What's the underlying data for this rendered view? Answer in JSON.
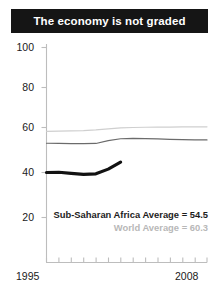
{
  "title": "The economy is not graded",
  "colors": {
    "title_bar_bg": "#151515",
    "title_text": "#ffffff",
    "axis": "#b0b0b0",
    "tick_text": "#1a1a1a",
    "series_africa": "#6b6b6b",
    "series_world": "#cfcfcf",
    "series_highlight": "#121212",
    "legend_africa_text": "#1c1c1c",
    "legend_world_text": "#b8b8b8"
  },
  "legend": {
    "africa": "Sub-Saharan Africa Average = 54.5",
    "world": "World Average = 60.3"
  },
  "axis": {
    "x_start_label": "1995",
    "x_end_label": "2008",
    "y_tick_labels": [
      "100",
      "80",
      "60",
      "40",
      "20"
    ]
  },
  "chart_data": {
    "type": "line",
    "title": "The economy is not graded",
    "xlabel": "",
    "ylabel": "",
    "xlim": [
      1995,
      2008
    ],
    "ylim": [
      10,
      100
    ],
    "grid": false,
    "legend_position": "inside-bottom-right",
    "yticks": [
      20,
      40,
      60,
      80,
      100
    ],
    "xticks": [
      1995,
      1996,
      1997,
      1998,
      1999,
      2000,
      2001,
      2002,
      2003,
      2004,
      2005,
      2006,
      2007,
      2008
    ],
    "x": [
      1995,
      1996,
      1997,
      1998,
      1999,
      2000,
      2001,
      2002,
      2003,
      2004,
      2005,
      2006,
      2007,
      2008
    ],
    "series": [
      {
        "name": "World Average",
        "color": "#cfcfcf",
        "width": 1.2,
        "annotation": "World Average = 60.3",
        "values": [
          58.3,
          58.4,
          58.5,
          58.6,
          58.9,
          59.4,
          59.8,
          60.0,
          60.1,
          60.2,
          60.2,
          60.3,
          60.3,
          60.3
        ]
      },
      {
        "name": "Sub-Saharan Africa Average",
        "color": "#6b6b6b",
        "width": 1.2,
        "annotation": "Sub-Saharan Africa Average = 54.5",
        "values": [
          53.0,
          52.9,
          52.8,
          52.8,
          52.9,
          54.2,
          55.0,
          55.2,
          55.1,
          54.9,
          54.7,
          54.6,
          54.5,
          54.5
        ]
      },
      {
        "name": "Highlighted country",
        "color": "#121212",
        "width": 3.2,
        "partial": true,
        "values": [
          40.0,
          40.1,
          39.6,
          39.2,
          39.4,
          41.5,
          44.6,
          null,
          null,
          null,
          null,
          null,
          null,
          null
        ]
      }
    ]
  }
}
